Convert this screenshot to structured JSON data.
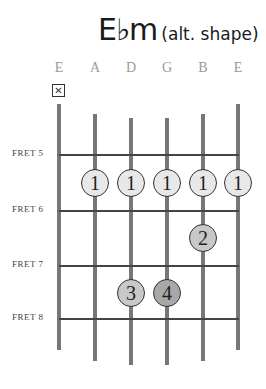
{
  "title": {
    "chord": "E♭m",
    "note": "(alt. shape)"
  },
  "strings": [
    {
      "label": "E",
      "x": 59,
      "top": 104,
      "bottom": 350
    },
    {
      "label": "A",
      "x": 95,
      "top": 114,
      "bottom": 361
    },
    {
      "label": "D",
      "x": 131,
      "top": 118,
      "bottom": 365
    },
    {
      "label": "G",
      "x": 167,
      "top": 118,
      "bottom": 365
    },
    {
      "label": "B",
      "x": 203,
      "top": 114,
      "bottom": 361
    },
    {
      "label": "E",
      "x": 238,
      "top": 104,
      "bottom": 350
    }
  ],
  "mute_symbol": "✕",
  "frets": [
    {
      "label": "FRET 5",
      "y": 155
    },
    {
      "label": "FRET 6",
      "y": 211
    },
    {
      "label": "FRET 7",
      "y": 266
    },
    {
      "label": "FRET 8",
      "y": 319
    }
  ],
  "fingers": [
    {
      "finger": "1",
      "string": "A",
      "x": 95,
      "y": 183,
      "fill": "#e8e8e8"
    },
    {
      "finger": "1",
      "string": "D",
      "x": 131,
      "y": 183,
      "fill": "#e8e8e8"
    },
    {
      "finger": "1",
      "string": "G",
      "x": 167,
      "y": 183,
      "fill": "#e8e8e8"
    },
    {
      "finger": "1",
      "string": "B",
      "x": 203,
      "y": 183,
      "fill": "#e8e8e8"
    },
    {
      "finger": "1",
      "string": "E",
      "x": 238,
      "y": 183,
      "fill": "#e8e8e8"
    },
    {
      "finger": "2",
      "string": "B",
      "x": 203,
      "y": 238,
      "fill": "#c8c8c8"
    },
    {
      "finger": "3",
      "string": "D",
      "x": 131,
      "y": 293,
      "fill": "#c8c8c8"
    },
    {
      "finger": "4",
      "string": "G",
      "x": 167,
      "y": 293,
      "fill": "#a8a8a8"
    }
  ]
}
